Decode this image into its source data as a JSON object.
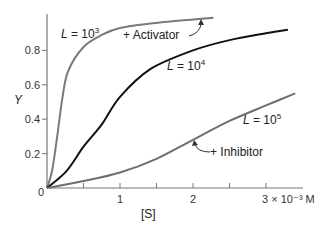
{
  "chart_data": {
    "type": "line",
    "title": "",
    "xlabel": "[S]",
    "ylabel": "Y",
    "xlim": [
      0,
      3.5
    ],
    "ylim": [
      0,
      1.0
    ],
    "x_unit_label": "3 × 10⁻³ M",
    "x_ticks": [
      0.5,
      1,
      1.5,
      2,
      2.5,
      3
    ],
    "x_tick_labels": [
      "",
      "1",
      "",
      "2",
      "",
      "3 × 10⁻³ M"
    ],
    "y_ticks": [
      0,
      0.2,
      0.4,
      0.6,
      0.8
    ],
    "y_tick_labels": [
      "0",
      "0.2",
      "0.4",
      "0.6",
      "0.8"
    ],
    "grid": false,
    "legend": "none (inline labels)",
    "series": [
      {
        "name": "L = 10^3",
        "label_base": "L = 10",
        "label_exp": "3",
        "color": "#7a7a7a",
        "annotation": "+ Activator",
        "x": [
          0,
          0.07,
          0.14,
          0.21,
          0.29,
          0.5,
          0.75,
          1.0,
          1.5,
          2.0,
          2.28
        ],
        "y": [
          0,
          0.1,
          0.3,
          0.52,
          0.68,
          0.82,
          0.89,
          0.93,
          0.96,
          0.98,
          0.99
        ]
      },
      {
        "name": "L = 10^4",
        "label_base": "L = 10",
        "label_exp": "4",
        "color": "#111111",
        "x": [
          0,
          0.27,
          0.5,
          0.75,
          1.0,
          1.41,
          2.0,
          2.5,
          3.0,
          3.3
        ],
        "y": [
          0,
          0.1,
          0.24,
          0.37,
          0.53,
          0.69,
          0.8,
          0.86,
          0.9,
          0.92
        ]
      },
      {
        "name": "L = 10^5",
        "label_base": "L = 10",
        "label_exp": "5",
        "color": "#6e6e6e",
        "annotation": "+ Inhibitor",
        "x": [
          0,
          0.5,
          1.0,
          1.5,
          2.0,
          2.5,
          3.0,
          3.4
        ],
        "y": [
          0,
          0.04,
          0.09,
          0.17,
          0.28,
          0.39,
          0.48,
          0.55
        ]
      }
    ]
  }
}
